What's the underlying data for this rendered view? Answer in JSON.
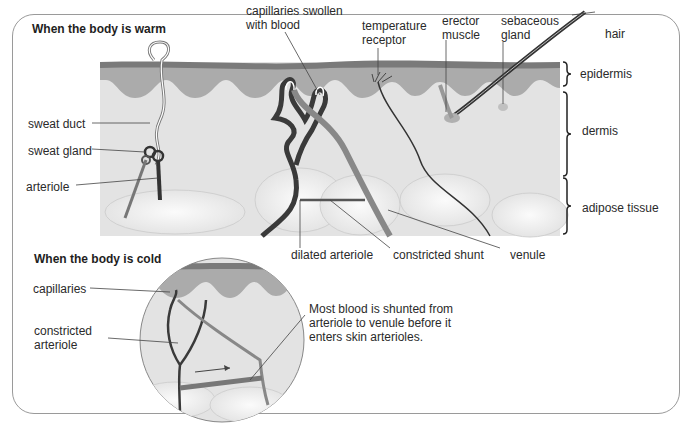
{
  "warm": {
    "title": "When the body is warm",
    "labels": {
      "capillaries_1": "capillaries swollen",
      "capillaries_2": "with blood",
      "temp_1": "temperature",
      "temp_2": "receptor",
      "erector_1": "erector",
      "erector_2": "muscle",
      "sebaceous_1": "sebaceous",
      "sebaceous_2": "gland",
      "hair": "hair",
      "epidermis": "epidermis",
      "dermis": "dermis",
      "adipose": "adipose tissue",
      "sweat_duct": "sweat duct",
      "sweat_gland": "sweat gland",
      "arteriole": "arteriole",
      "dilated_arteriole": "dilated arteriole",
      "constricted_shunt": "constricted shunt",
      "venule": "venule"
    }
  },
  "cold": {
    "title": "When the body is cold",
    "labels": {
      "capillaries": "capillaries",
      "constricted_1": "constricted",
      "constricted_2": "arteriole",
      "note_1": "Most blood is shunted from",
      "note_2": "arteriole to venule before it",
      "note_3": "enters skin arterioles."
    }
  },
  "colors": {
    "epidermis_top": "#7a7a7a",
    "epidermis": "#a8a8a8",
    "dermis": "#e2e2e2",
    "vessel_dark": "#3a3a3a",
    "vessel_mid": "#8a8a8a",
    "frame": "#9a9a9a"
  }
}
